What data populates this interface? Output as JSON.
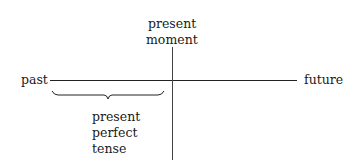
{
  "diagram": {
    "type": "timeline",
    "axis": {
      "left_label": "past",
      "right_label": "future"
    },
    "marker": {
      "label_line1": "present",
      "label_line2": "moment"
    },
    "span": {
      "label_line1": "present",
      "label_line2": "perfect",
      "label_line3": "tense"
    }
  }
}
